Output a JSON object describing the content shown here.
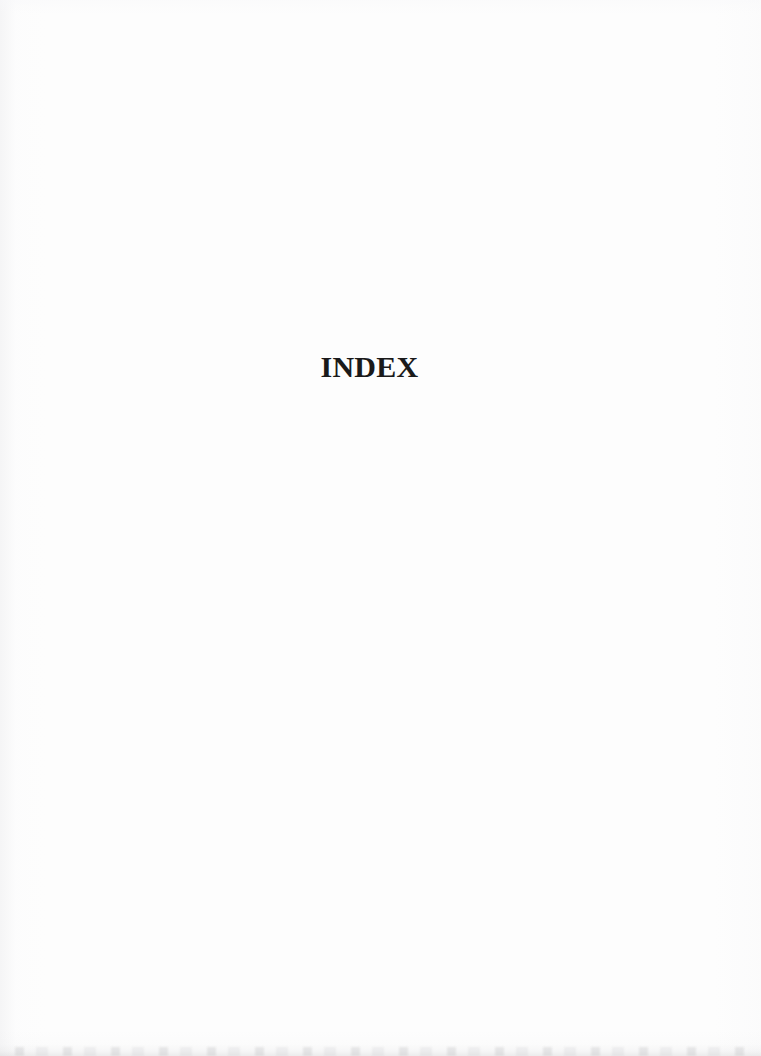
{
  "document": {
    "type": "scanned-book-page",
    "page_kind": "section-divider",
    "background_color": "#fdfdfd",
    "ink_color": "#1a1a1a",
    "heading": {
      "text": "INDEX",
      "style": "bold-serif-caps",
      "align": "center"
    },
    "body": {
      "blocks": [],
      "note": ""
    },
    "artifacts": {
      "bottom_edge_smudge": true,
      "left_edge_shadow": true
    }
  }
}
